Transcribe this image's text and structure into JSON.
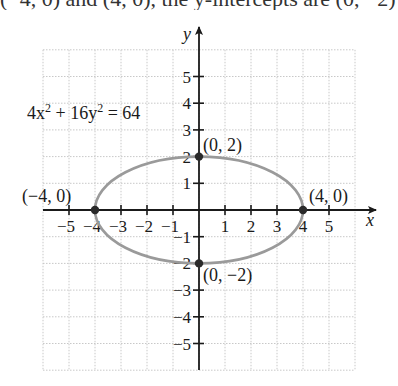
{
  "top_fragment": {
    "text": "(−4, 0) and (4, 0), the y-intercepts are (0, −2) and (0, 2)."
  },
  "chart_data": {
    "type": "line",
    "title": "",
    "equation_label": "4x² + 16y² = 64",
    "equation": {
      "lhs_a": "4x",
      "lhs_a_exp": "2",
      "plus": " + ",
      "lhs_b": "16y",
      "lhs_b_exp": "2",
      "rhs": " = 64"
    },
    "xlabel": "x",
    "ylabel": "y",
    "xlim": [
      -6,
      6
    ],
    "ylim": [
      -6,
      6
    ],
    "grid": true,
    "x_ticks": [
      -5,
      -4,
      -3,
      -2,
      -1,
      1,
      2,
      3,
      4,
      5
    ],
    "x_tick_labels": [
      "−5",
      "−4",
      "−3",
      "−2",
      "−1",
      "1",
      "2",
      "3",
      "4",
      "5"
    ],
    "y_ticks": [
      -5,
      -4,
      -3,
      -2,
      -1,
      1,
      2,
      3,
      4,
      5
    ],
    "y_tick_labels": [
      "−5",
      "−4",
      "−3",
      "−2",
      "−1",
      "1",
      "2",
      "3",
      "4",
      "5"
    ],
    "curve": {
      "shape": "ellipse",
      "center": [
        0,
        0
      ],
      "semi_major_x": 4,
      "semi_minor_y": 2,
      "color": "#9a9a9a"
    },
    "points": [
      {
        "x": -4,
        "y": 0,
        "label": "(−4, 0)"
      },
      {
        "x": 4,
        "y": 0,
        "label": "(4, 0)"
      },
      {
        "x": 0,
        "y": 2,
        "label": "(0, 2)"
      },
      {
        "x": 0,
        "y": -2,
        "label": "(0, −2)"
      }
    ]
  }
}
